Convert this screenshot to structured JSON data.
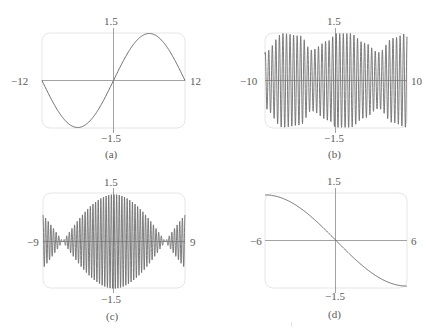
{
  "chart_data": [
    {
      "id": "a",
      "type": "line",
      "caption": "(a)",
      "title": "",
      "xlabel": "",
      "ylabel": "",
      "xlim": [
        -12,
        12
      ],
      "ylim": [
        -1.5,
        1.5
      ],
      "tick_labels": {
        "x_min": "−12",
        "x_max": "12",
        "y_max": "1.5",
        "y_min": "−1.5"
      },
      "grid": false,
      "description": "single smooth sine period: y ≈ sin(πx/12), minimum ≈ -1 at x≈-6, maximum ≈ 1 at x≈6",
      "x": [
        -12,
        -9,
        -6,
        -3,
        0,
        3,
        6,
        9,
        12
      ],
      "y": [
        0,
        -0.71,
        -1,
        -0.71,
        0,
        0.71,
        1,
        0.71,
        0
      ]
    },
    {
      "id": "b",
      "type": "line",
      "caption": "(b)",
      "title": "",
      "xlabel": "",
      "ylabel": "",
      "xlim": [
        -10,
        10
      ],
      "ylim": [
        -1.5,
        1.5
      ],
      "tick_labels": {
        "x_min": "−10",
        "x_max": "10",
        "y_max": "1.5",
        "y_min": "−1.5"
      },
      "grid": false,
      "description": "high-frequency oscillation (~40 cycles) with slowly varying amplitude between ~0.6 and ~1.0; envelope dips near x≈-3.5 and x≈6",
      "envelope_x": [
        -10,
        -7.5,
        -5,
        -3.5,
        -1,
        0,
        2,
        4,
        6,
        8,
        10
      ],
      "envelope_y": [
        0.6,
        1.0,
        0.95,
        0.65,
        0.85,
        1.0,
        1.0,
        0.8,
        0.6,
        0.9,
        1.0
      ]
    },
    {
      "id": "c",
      "type": "line",
      "caption": "(c)",
      "title": "",
      "xlabel": "",
      "ylabel": "",
      "xlim": [
        -9,
        9
      ],
      "ylim": [
        -1.5,
        1.5
      ],
      "tick_labels": {
        "x_min": "−9",
        "x_max": "9",
        "y_max": "1.5",
        "y_min": "−1.5"
      },
      "grid": false,
      "description": "beat pattern: fast oscillation (~55 cycles) inside envelope |cos(πx/13)|, max ≈ 1 at x=0, near zero at x≈±6.5, growing again toward edges",
      "envelope_x": [
        -9,
        -6.5,
        -3,
        0,
        3,
        6.5,
        9
      ],
      "envelope_y": [
        0.75,
        0.02,
        0.7,
        1.0,
        0.7,
        0.02,
        0.75
      ]
    },
    {
      "id": "d",
      "type": "line",
      "caption": "(d)",
      "title": "",
      "xlabel": "",
      "ylabel": "",
      "xlim": [
        -6,
        6
      ],
      "ylim": [
        -1.5,
        1.5
      ],
      "tick_labels": {
        "x_min": "−6",
        "x_max": "6",
        "y_max": "1.5",
        "y_min": "−1.5"
      },
      "grid": false,
      "description": "smooth decreasing curve through origin, y ≈ -sin(πx/12)",
      "x": [
        -6,
        -4.5,
        -3,
        -1.5,
        0,
        1.5,
        3,
        4.5,
        6
      ],
      "y": [
        0.97,
        0.9,
        0.7,
        0.38,
        0,
        -0.38,
        -0.7,
        -0.9,
        -0.97
      ]
    }
  ],
  "panels": {
    "a": {
      "caption": "(a)",
      "y_max": "1.5",
      "y_min": "−1.5",
      "x_min": "−12",
      "x_max": "12"
    },
    "b": {
      "caption": "(b)",
      "y_max": "1.5",
      "y_min": "−1.5",
      "x_min": "−10",
      "x_max": "10"
    },
    "c": {
      "caption": "(c)",
      "y_max": "1.5",
      "y_min": "−1.5",
      "x_min": "−9",
      "x_max": "9"
    },
    "d": {
      "caption": "(d)",
      "y_max": "1.5",
      "y_min": "−1.5",
      "x_min": "−6",
      "x_max": "6"
    }
  },
  "colors": {
    "curve": "#6e6e6e",
    "axis": "#8a8a8a",
    "frame": "#e6e6e6",
    "text": "#5a5a5a"
  }
}
